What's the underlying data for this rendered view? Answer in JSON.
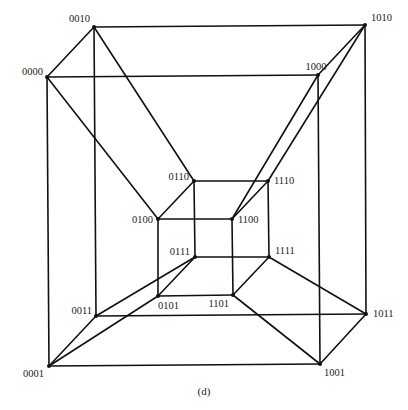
{
  "caption": "(d)",
  "diagram": {
    "type": "4-dimensional hypercube graph",
    "nodes": [
      {
        "id": "0000",
        "label": "0000"
      },
      {
        "id": "0001",
        "label": "0001"
      },
      {
        "id": "0010",
        "label": "0010"
      },
      {
        "id": "0011",
        "label": "0011"
      },
      {
        "id": "0100",
        "label": "0100"
      },
      {
        "id": "0101",
        "label": "0101"
      },
      {
        "id": "0110",
        "label": "0110"
      },
      {
        "id": "0111",
        "label": "0111"
      },
      {
        "id": "1000",
        "label": "1000"
      },
      {
        "id": "1001",
        "label": "1001"
      },
      {
        "id": "1010",
        "label": "1010"
      },
      {
        "id": "1011",
        "label": "1011"
      },
      {
        "id": "1100",
        "label": "1100"
      },
      {
        "id": "1101",
        "label": "1101"
      },
      {
        "id": "1110",
        "label": "1110"
      },
      {
        "id": "1111",
        "label": "1111"
      }
    ],
    "edges": [
      [
        "0000",
        "0010"
      ],
      [
        "0000",
        "1000"
      ],
      [
        "0000",
        "0001"
      ],
      [
        "0000",
        "0100"
      ],
      [
        "0010",
        "1010"
      ],
      [
        "0010",
        "0011"
      ],
      [
        "0010",
        "0110"
      ],
      [
        "1010",
        "1000"
      ],
      [
        "1010",
        "1011"
      ],
      [
        "1010",
        "1110"
      ],
      [
        "1000",
        "1001"
      ],
      [
        "1000",
        "1100"
      ],
      [
        "0110",
        "1110"
      ],
      [
        "0110",
        "0100"
      ],
      [
        "0110",
        "0111"
      ],
      [
        "1110",
        "1100"
      ],
      [
        "1110",
        "1111"
      ],
      [
        "0100",
        "1100"
      ],
      [
        "0100",
        "0101"
      ],
      [
        "1100",
        "1101"
      ],
      [
        "0111",
        "1111"
      ],
      [
        "0111",
        "0101"
      ],
      [
        "0111",
        "0011"
      ],
      [
        "1111",
        "1101"
      ],
      [
        "1111",
        "1011"
      ],
      [
        "0101",
        "1101"
      ],
      [
        "0101",
        "0001"
      ],
      [
        "1101",
        "1001"
      ],
      [
        "0011",
        "1011"
      ],
      [
        "0011",
        "0001"
      ],
      [
        "0001",
        "1001"
      ],
      [
        "1011",
        "1001"
      ]
    ]
  }
}
